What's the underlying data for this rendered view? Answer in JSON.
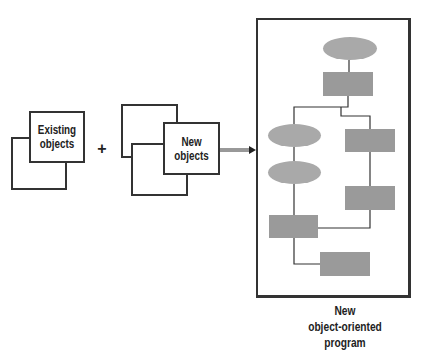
{
  "diagram": {
    "existing_objects": {
      "label_line1": "Existing",
      "label_line2": "objects"
    },
    "operator": "+",
    "new_objects": {
      "label_line1": "New",
      "label_line2": "objects"
    },
    "result": {
      "caption_line1": "New",
      "caption_line2": "object-oriented",
      "caption_line3": "program"
    },
    "flowchart": {
      "nodes": [
        {
          "id": "top-oval",
          "shape": "oval"
        },
        {
          "id": "top-rect",
          "shape": "rect"
        },
        {
          "id": "left-oval-1",
          "shape": "oval"
        },
        {
          "id": "left-oval-2",
          "shape": "oval"
        },
        {
          "id": "right-rect-1",
          "shape": "rect"
        },
        {
          "id": "right-rect-2",
          "shape": "rect"
        },
        {
          "id": "left-rect",
          "shape": "rect"
        },
        {
          "id": "bottom-rect",
          "shape": "rect"
        }
      ]
    },
    "colors": {
      "stroke": "#333333",
      "shape_fill": "#a0a0a0",
      "background": "#ffffff"
    }
  }
}
